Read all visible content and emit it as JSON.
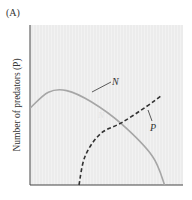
{
  "panel": {
    "label": "(A)"
  },
  "chart_data": {
    "type": "line",
    "title": "",
    "xlabel": "",
    "ylabel": "Number of predators (P)",
    "grid": false,
    "legend": "inline curve labels",
    "x_ticks": [],
    "y_ticks": [],
    "xlim": [
      0,
      1
    ],
    "ylim": [
      0,
      1
    ],
    "series": [
      {
        "name": "N",
        "style": "solid",
        "color": "#a6a6a6",
        "points": [
          [
            0.0,
            0.48
          ],
          [
            0.12,
            0.58
          ],
          [
            0.24,
            0.59
          ],
          [
            0.4,
            0.52
          ],
          [
            0.6,
            0.38
          ],
          [
            0.8,
            0.18
          ],
          [
            0.88,
            0.0
          ]
        ]
      },
      {
        "name": "P",
        "style": "dashed",
        "color": "#333333",
        "points": [
          [
            0.32,
            0.0
          ],
          [
            0.36,
            0.18
          ],
          [
            0.46,
            0.32
          ],
          [
            0.6,
            0.39
          ],
          [
            0.76,
            0.49
          ],
          [
            0.86,
            0.56
          ]
        ]
      }
    ],
    "annotations": [
      {
        "text": "N",
        "target": "N"
      },
      {
        "text": "P",
        "target": "P"
      }
    ]
  },
  "colors": {
    "plot_background": "#ececec",
    "axis": "#444444",
    "n_curve": "#a6a6a6",
    "p_curve": "#333333",
    "text": "#333333"
  }
}
